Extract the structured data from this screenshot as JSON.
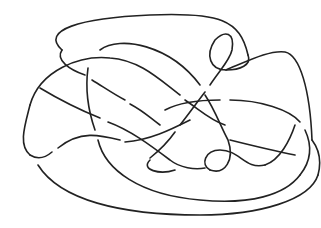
{
  "diagram": {
    "type": "knot-diagram",
    "background": "#ffffff",
    "stroke_color": "#222222",
    "stroke_width": 1.6,
    "strands": [
      "M 62 50 C 40 30, 80 18, 150 15 C 220 12, 240 20, 248 55",
      "M 62 50 C 55 60, 70 70, 85 75",
      "M 92 80 C 105 88, 115 95, 125 100",
      "M 130 104 C 145 112, 150 118, 160 125",
      "M 248 55 C 252 65, 240 70, 226 70 C 210 70, 205 55, 215 40 C 225 30, 235 32, 232 50 C 230 60, 220 70, 210 85",
      "M 205 92 C 195 105, 188 115, 180 125",
      "M 175 132 C 168 142, 160 150, 150 158",
      "M 226 70 C 250 60, 270 50, 285 52 C 300 55, 310 90, 312 140",
      "M 30 105 C 40 70, 80 55, 110 58 C 140 60, 160 80, 180 95",
      "M 185 100 C 200 110, 210 120, 225 125",
      "M 30 105 C 25 125, 18 145, 30 155",
      "M 30 155 C 38 160, 45 158, 52 152",
      "M 58 148 C 80 130, 100 135, 120 140",
      "M 125 142 C 150 140, 170 130, 190 120",
      "M 100 50 C 120 35, 170 45, 200 85",
      "M 205 95 C 215 110, 220 125, 228 140 C 235 160, 225 175, 210 170",
      "M 210 170 C 200 165, 205 150, 220 150 C 240 150, 245 170, 265 165",
      "M 265 165 C 280 160, 290 140, 295 125",
      "M 88 68 C 85 90, 88 110, 95 130",
      "M 98 140 C 105 170, 140 195, 200 200 C 250 205, 285 195, 300 175",
      "M 300 175 C 312 160, 312 145, 305 130",
      "M 300 122 C 290 110, 260 100, 230 100",
      "M 220 100 C 200 100, 180 102, 165 110",
      "M 38 165 C 60 200, 120 215, 200 215 C 260 215, 310 200, 318 175",
      "M 318 175 C 322 160, 318 148, 312 140",
      "M 40 88 C 60 100, 80 110, 100 118",
      "M 108 122 C 130 130, 150 145, 170 160 C 180 168, 195 170, 205 168",
      "M 150 160 C 140 170, 160 175, 175 170",
      "M 230 140 C 250 145, 270 150, 295 155"
    ]
  }
}
